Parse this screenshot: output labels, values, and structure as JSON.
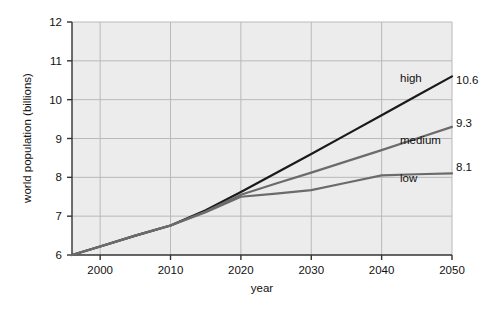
{
  "chart_data": {
    "type": "line",
    "title": "",
    "xlabel": "year",
    "ylabel": "world population (billions)",
    "xlim": [
      1996,
      2050
    ],
    "ylim": [
      6,
      12
    ],
    "grid": true,
    "legend": "inline-right",
    "x_ticks": [
      "2000",
      "2010",
      "2020",
      "2030",
      "2040",
      "2050"
    ],
    "x_tick_values": [
      2000,
      2010,
      2020,
      2030,
      2040,
      2050
    ],
    "y_ticks": [
      "6",
      "7",
      "8",
      "9",
      "10",
      "11",
      "12"
    ],
    "y_tick_values": [
      6,
      7,
      8,
      9,
      10,
      11,
      12
    ],
    "x": [
      1996,
      2000,
      2005,
      2010,
      2015,
      2020,
      2025,
      2030,
      2035,
      2040,
      2045,
      2050
    ],
    "series": [
      {
        "name": "high",
        "label": "high",
        "end_value_label": "10.6",
        "end_value": 10.6,
        "color": "#1a1a1a",
        "width": 2.2,
        "values": [
          6.0,
          6.22,
          6.5,
          6.76,
          7.15,
          7.62,
          8.11,
          8.6,
          9.1,
          9.6,
          10.1,
          10.6
        ]
      },
      {
        "name": "medium",
        "label": "medium",
        "end_value_label": "9.3",
        "end_value": 9.3,
        "color": "#6b6b6b",
        "width": 2.2,
        "values": [
          6.0,
          6.22,
          6.5,
          6.76,
          7.12,
          7.55,
          7.84,
          8.12,
          8.41,
          8.7,
          9.0,
          9.3
        ]
      },
      {
        "name": "low",
        "label": "low",
        "end_value_label": "8.1",
        "end_value": 8.1,
        "color": "#6b6b6b",
        "width": 2.2,
        "values": [
          6.0,
          6.22,
          6.5,
          6.76,
          7.1,
          7.5,
          7.58,
          7.67,
          7.86,
          8.05,
          8.08,
          8.1
        ]
      }
    ],
    "annotations": [
      {
        "name": "high-label",
        "text": "high",
        "x_px": 400,
        "y_px": 82
      },
      {
        "name": "medium-label",
        "text": "medium",
        "x_px": 400,
        "y_px": 144
      },
      {
        "name": "low-label",
        "text": "low",
        "x_px": 400,
        "y_px": 182
      },
      {
        "name": "high-end-value",
        "text": "10.6",
        "x_px": 456,
        "y_px": 84
      },
      {
        "name": "medium-end-value",
        "text": "9.3",
        "x_px": 456,
        "y_px": 127
      },
      {
        "name": "low-end-value",
        "text": "8.1",
        "x_px": 456,
        "y_px": 171
      }
    ],
    "style": {
      "plot_background": "#ececec",
      "grid_color": "#b9b9b9",
      "axis_color": "#333333",
      "page_background": "#ffffff"
    }
  }
}
